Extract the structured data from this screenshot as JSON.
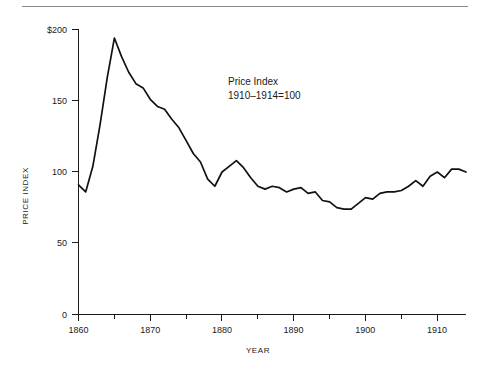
{
  "chart_data": {
    "type": "line",
    "title": "",
    "annotation": [
      "Price Index",
      "1910–1914=100"
    ],
    "xlabel": "YEAR",
    "ylabel": "PRICE INDEX",
    "xlim": [
      1860,
      1914
    ],
    "ylim": [
      0,
      200
    ],
    "grid": false,
    "legend": null,
    "x_ticks_major": [
      1860,
      1870,
      1880,
      1890,
      1900,
      1910
    ],
    "x_tick_labels": [
      "1860",
      "1870",
      "1880",
      "1890",
      "1900",
      "1910"
    ],
    "x_ticks_minor": [
      1865,
      1875,
      1885,
      1895,
      1905
    ],
    "y_ticks": [
      0,
      50,
      100,
      150,
      200
    ],
    "y_tick_labels": [
      "0",
      "50",
      "100",
      "150",
      "$200"
    ],
    "series": [
      {
        "name": "Price Index",
        "x": [
          1860,
          1861,
          1862,
          1863,
          1864,
          1865,
          1866,
          1867,
          1868,
          1869,
          1870,
          1871,
          1872,
          1873,
          1874,
          1875,
          1876,
          1877,
          1878,
          1879,
          1880,
          1881,
          1882,
          1883,
          1884,
          1885,
          1886,
          1887,
          1888,
          1889,
          1890,
          1891,
          1892,
          1893,
          1894,
          1895,
          1896,
          1897,
          1898,
          1899,
          1900,
          1901,
          1902,
          1903,
          1904,
          1905,
          1906,
          1907,
          1908,
          1909,
          1910,
          1911,
          1912,
          1913,
          1914
        ],
        "y": [
          91,
          86,
          104,
          133,
          166,
          194,
          181,
          170,
          162,
          159,
          151,
          146,
          144,
          137,
          131,
          122,
          113,
          107,
          95,
          90,
          100,
          104,
          108,
          103,
          96,
          90,
          88,
          90,
          89,
          86,
          88,
          89,
          85,
          86,
          80,
          79,
          75,
          74,
          74,
          78,
          82,
          81,
          85,
          86,
          86,
          87,
          90,
          94,
          90,
          97,
          100,
          96,
          102,
          102,
          100
        ],
        "color": "#111111"
      }
    ]
  },
  "figure": {
    "top_rule": true
  }
}
